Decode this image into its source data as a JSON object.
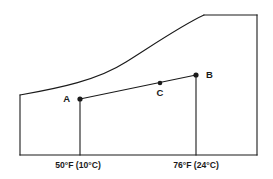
{
  "figure": {
    "title": "",
    "background_color": "#ffffff",
    "line_color": "#1a1a1a"
  },
  "axis_labels": [
    {
      "id": "left-temp",
      "text": "50°F (10°C)",
      "x": 78,
      "y": 168
    },
    {
      "id": "right-temp",
      "text": "76°F (24°C)",
      "x": 196,
      "y": 168
    }
  ],
  "points": [
    {
      "id": "A",
      "label": "A",
      "x": 80,
      "y": 99,
      "label_x": 70,
      "label_y": 102
    },
    {
      "id": "C",
      "label": "C",
      "x": 160,
      "y": 83,
      "label_x": 160,
      "label_y": 96
    },
    {
      "id": "B",
      "label": "B",
      "x": 196,
      "y": 75,
      "label_x": 206,
      "label_y": 78
    }
  ],
  "geometry": {
    "saturation_curve": "M 20,95 C 60,88 98,80 126,62 C 156,43 184,24 204,15",
    "top_edge": "M 204,15 L 257,15",
    "right_edge": "M 257,15 L 257,155",
    "bottom_edge": "M 20,155 L 257,155",
    "left_edge": "M 20,155 L 20,95",
    "process_line": "M 80,99 L 196,75",
    "left_dry_bulb_line": "M 80,99 L 80,155",
    "right_dry_bulb_line": "M 196,75 L 196,155"
  },
  "chart_data": {
    "type": "line",
    "title": "",
    "xlabel": "",
    "ylabel": "",
    "categories": [
      "50°F (10°C)",
      "76°F (24°C)"
    ],
    "series": [
      {
        "name": "process A to B",
        "points": [
          {
            "label": "A",
            "x": "50°F (10°C)",
            "px": 80,
            "py": 99
          },
          {
            "label": "C",
            "x": "",
            "px": 160,
            "py": 83
          },
          {
            "label": "B",
            "x": "76°F (24°C)",
            "px": 196,
            "py": 75
          }
        ]
      },
      {
        "name": "saturation curve",
        "points": [
          {
            "px": 20,
            "py": 95
          },
          {
            "px": 126,
            "py": 62
          },
          {
            "px": 204,
            "py": 15
          }
        ]
      }
    ],
    "grid": false,
    "legend": "none"
  }
}
